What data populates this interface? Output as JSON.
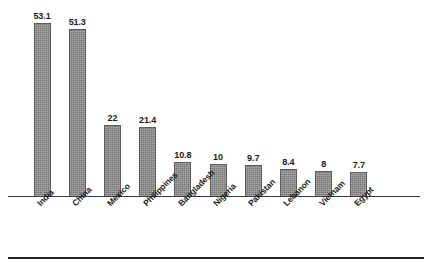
{
  "chart_data": {
    "type": "bar",
    "title": "",
    "subtitle": "",
    "xlabel": "",
    "ylabel": "",
    "categories": [
      "India",
      "China",
      "Mexico",
      "Philippines",
      "Bangladesh",
      "Nigeria",
      "Pakistan",
      "Lebanon",
      "Vietnam",
      "Egypt"
    ],
    "values": [
      53.1,
      51.3,
      22,
      21.4,
      10.8,
      10,
      9.7,
      8.4,
      8,
      7.7
    ],
    "value_labels": [
      "53.1",
      "51.3",
      "22",
      "21.4",
      "10.8",
      "10",
      "9.7",
      "8.4",
      "8",
      "7.7"
    ],
    "ylim": [
      0,
      59
    ],
    "grid": false,
    "legend": false,
    "legend_position": "none",
    "y_axis_visible": false,
    "x_axis_visible": true,
    "data_labels_shown": true,
    "category_label_rotation": -45,
    "bar_color": "#8f8f8f",
    "bar_border_color": "#5d5d5d",
    "axis_color": "#3a3a3a",
    "text_color": "#1b1b1b",
    "background_color": "#ffffff"
  },
  "figure": {
    "bottom_rule_color": "#242424"
  }
}
